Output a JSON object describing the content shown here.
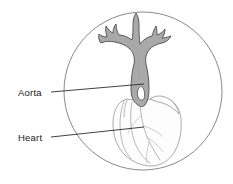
{
  "figure": {
    "frame_shape": "circle",
    "background_color": "#ffffff",
    "frame_stroke_color": "#6b6b6b"
  },
  "labels": [
    {
      "id": "aorta",
      "text": "Aorta",
      "text_x": 18,
      "text_y": 96,
      "leader_from_x": 51,
      "leader_from_y": 92,
      "leader_to_x": 144,
      "leader_to_y": 84
    },
    {
      "id": "heart",
      "text": "Heart",
      "text_x": 18,
      "text_y": 141,
      "leader_from_x": 51,
      "leader_from_y": 137,
      "leader_to_x": 144,
      "leader_to_y": 127
    }
  ],
  "structures": {
    "aorta": {
      "name": "Aorta",
      "fill_color": "#a9a9a9",
      "stroke_color": "#4d4d4d",
      "description": "Shaded branching great vessel with aortic arch and three upper branch trunks"
    },
    "heart": {
      "name": "Heart",
      "fill_color": "#fdfdfd",
      "stroke_color": "#9a9a9a",
      "description": "Outlined heart with coronary vessels below the aorta"
    }
  },
  "frame": {
    "center_x": 143,
    "center_y": 91,
    "radius": 79
  }
}
